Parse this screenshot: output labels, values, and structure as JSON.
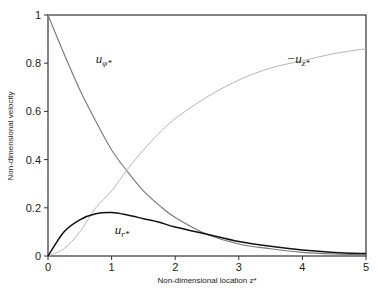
{
  "chart_data": {
    "type": "line",
    "title": "",
    "xlabel": "Non-dimensional location z*",
    "ylabel": "Non-dimensional velocity",
    "xlim": [
      0,
      5
    ],
    "ylim": [
      0,
      1
    ],
    "x_ticks": [
      "0",
      "1",
      "2",
      "3",
      "4",
      "5"
    ],
    "y_ticks": [
      "0",
      "0.2",
      "0.4",
      "0.6",
      "0.8",
      "1"
    ],
    "grid": false,
    "legend": "none (inline curve labels)",
    "x": [
      0,
      0.25,
      0.5,
      0.75,
      1.0,
      1.25,
      1.5,
      1.75,
      2.0,
      2.5,
      3.0,
      3.5,
      4.0,
      4.5,
      5.0
    ],
    "series": [
      {
        "name": "u_phi*",
        "label_main": "u",
        "label_sub": "φ*",
        "color": "#777777",
        "width": 1.1,
        "values": [
          1.0,
          0.84,
          0.69,
          0.56,
          0.44,
          0.35,
          0.27,
          0.21,
          0.16,
          0.09,
          0.05,
          0.03,
          0.015,
          0.008,
          0.005
        ]
      },
      {
        "name": "-u_z*",
        "label_main": "−u",
        "label_sub": "z*",
        "color": "#b5b5b5",
        "width": 1.0,
        "values": [
          0.0,
          0.03,
          0.1,
          0.2,
          0.27,
          0.36,
          0.44,
          0.51,
          0.57,
          0.66,
          0.73,
          0.78,
          0.81,
          0.84,
          0.86
        ]
      },
      {
        "name": "u_r*",
        "label_main": "u",
        "label_sub": "r*",
        "color": "#111111",
        "width": 1.5,
        "values": [
          0.0,
          0.1,
          0.15,
          0.175,
          0.18,
          0.17,
          0.155,
          0.14,
          0.12,
          0.09,
          0.06,
          0.04,
          0.025,
          0.015,
          0.01
        ]
      }
    ],
    "annotations": [
      {
        "text": "u_φ*",
        "x": 0.75,
        "y": 0.8
      },
      {
        "text": "−u_z*",
        "x": 3.75,
        "y": 0.8
      },
      {
        "text": "u_r*",
        "x": 1.05,
        "y": 0.09
      }
    ]
  }
}
